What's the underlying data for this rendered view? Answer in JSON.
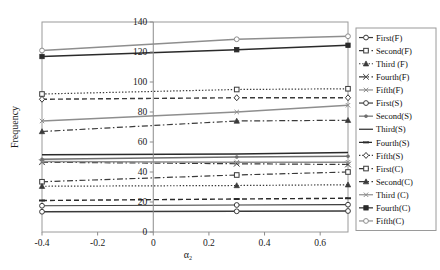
{
  "axes": {
    "ylabel": "Frequency",
    "xlabel": "α₂",
    "xticks": [
      "-0.4",
      "-0.2",
      "0",
      "0.2",
      "0.4",
      "0.6"
    ],
    "xtick_values": [
      -0.4,
      -0.2,
      0,
      0.2,
      0.4,
      0.6
    ],
    "yticks": [
      "0",
      "20",
      "40",
      "60",
      "80",
      "100",
      "120",
      "140"
    ],
    "ytick_values": [
      0,
      20,
      40,
      60,
      80,
      100,
      120,
      140
    ],
    "xlim": [
      -0.4,
      0.7
    ],
    "ylim": [
      0,
      140
    ],
    "grid": false,
    "yaxis_at_x": 0
  },
  "legend": {
    "position": "right-outside",
    "entries": [
      {
        "label": "First(F)",
        "marker": "circle-open",
        "dash": "solid",
        "color": "#3a3a3a"
      },
      {
        "label": "Second(F)",
        "marker": "square-open",
        "dash": "dashdot",
        "color": "#3a3a3a"
      },
      {
        "label": "Third (F)",
        "marker": "triangle-solid",
        "dash": "dotted",
        "color": "#3a3a3a"
      },
      {
        "label": "Fourth(F)",
        "marker": "cross",
        "dash": "dashdot",
        "color": "#3a3a3a"
      },
      {
        "label": "Fifth(F)",
        "marker": "x-small",
        "dash": "solid",
        "color": "#8e8e8e"
      },
      {
        "label": "First(S)",
        "marker": "circle-open",
        "dash": "solid",
        "color": "#3a3a3a"
      },
      {
        "label": "Second(S)",
        "marker": "dot",
        "dash": "solid",
        "color": "#6e6e6e"
      },
      {
        "label": "Third(S)",
        "marker": "none",
        "dash": "solid",
        "color": "#2a2a2a"
      },
      {
        "label": "Fourth(S)",
        "marker": "dash",
        "dash": "dashed",
        "color": "#2a2a2a"
      },
      {
        "label": "Fifth(S)",
        "marker": "diamond-open",
        "dash": "dotted",
        "color": "#3a3a3a"
      },
      {
        "label": "First(C)",
        "marker": "square-open",
        "dash": "dashdot",
        "color": "#3a3a3a"
      },
      {
        "label": "Second(C)",
        "marker": "triangle-solid",
        "dash": "dashdot",
        "color": "#3a3a3a"
      },
      {
        "label": "Third (C)",
        "marker": "x-small",
        "dash": "solid",
        "color": "#8e8e8e"
      },
      {
        "label": "Fourth(C)",
        "marker": "square-solid",
        "dash": "solid",
        "color": "#2a2a2a"
      },
      {
        "label": "Fifth(C)",
        "marker": "circle-open",
        "dash": "solid",
        "color": "#8e8e8e"
      }
    ]
  },
  "chart_data": {
    "type": "line",
    "title": "",
    "xlabel": "α₂",
    "ylabel": "Frequency",
    "x": [
      -0.4,
      0.3,
      0.7
    ],
    "xlim": [
      -0.4,
      0.7
    ],
    "ylim": [
      0,
      140
    ],
    "grid": false,
    "series": [
      {
        "name": "First(F)",
        "values": [
          13.5,
          13.8,
          14.0
        ],
        "marker": "circle-open",
        "dash": "solid",
        "color": "#3a3a3a",
        "width": 1.4
      },
      {
        "name": "Second(F)",
        "values": [
          33.5,
          38.0,
          40.0
        ],
        "marker": "square-open",
        "dash": "dashdot",
        "color": "#3a3a3a",
        "width": 1.2
      },
      {
        "name": "Third (F)",
        "values": [
          30.5,
          31.0,
          31.5
        ],
        "marker": "triangle-solid",
        "dash": "dotted",
        "color": "#3a3a3a",
        "width": 1.2
      },
      {
        "name": "Fourth(F)",
        "values": [
          46.5,
          45.5,
          45.0
        ],
        "marker": "cross",
        "dash": "dashdot",
        "color": "#3a3a3a",
        "width": 1.2
      },
      {
        "name": "Fifth(F)",
        "values": [
          47.0,
          46.5,
          46.5
        ],
        "marker": "x-small",
        "dash": "solid",
        "color": "#8e8e8e",
        "width": 1.6
      },
      {
        "name": "First(S)",
        "values": [
          17.5,
          18.0,
          18.2
        ],
        "marker": "circle-open",
        "dash": "solid",
        "color": "#3a3a3a",
        "width": 1.2
      },
      {
        "name": "Second(S)",
        "values": [
          48.5,
          50.0,
          50.5
        ],
        "marker": "dot",
        "dash": "solid",
        "color": "#6e6e6e",
        "width": 1.6
      },
      {
        "name": "Third(S)",
        "values": [
          51.5,
          52.0,
          53.0
        ],
        "marker": "none",
        "dash": "solid",
        "color": "#2a2a2a",
        "width": 1.4
      },
      {
        "name": "Fourth(S)",
        "values": [
          21.0,
          22.0,
          22.5
        ],
        "marker": "dash",
        "dash": "dashed",
        "color": "#2a2a2a",
        "width": 1.4
      },
      {
        "name": "Fifth(S)",
        "values": [
          88.5,
          89.5,
          89.5
        ],
        "marker": "diamond-open",
        "dash": "dashed",
        "color": "#3a3a3a",
        "width": 1.4
      },
      {
        "name": "First(C)",
        "values": [
          92.0,
          95.0,
          95.5
        ],
        "marker": "square-open",
        "dash": "dotted",
        "color": "#3a3a3a",
        "width": 1.2
      },
      {
        "name": "Second(C)",
        "values": [
          67.0,
          74.0,
          74.5
        ],
        "marker": "triangle-solid",
        "dash": "dashdot",
        "color": "#3a3a3a",
        "width": 1.2
      },
      {
        "name": "Third (C)",
        "values": [
          74.0,
          80.0,
          84.5
        ],
        "marker": "x-small",
        "dash": "solid",
        "color": "#8e8e8e",
        "width": 1.4
      },
      {
        "name": "Fourth(C)",
        "values": [
          117.0,
          121.5,
          124.5
        ],
        "marker": "square-solid",
        "dash": "solid",
        "color": "#2a2a2a",
        "width": 1.6
      },
      {
        "name": "Fifth(C)",
        "values": [
          121.0,
          128.5,
          130.5
        ],
        "marker": "circle-open",
        "dash": "solid",
        "color": "#8e8e8e",
        "width": 1.4
      }
    ]
  }
}
